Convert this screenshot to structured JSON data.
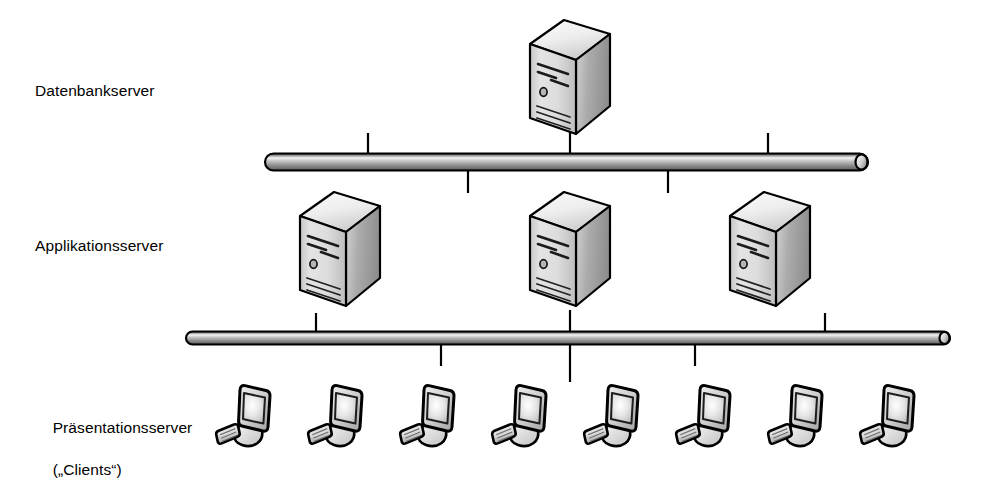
{
  "diagram": {
    "type": "three-tier-architecture",
    "background_color": "#ffffff",
    "line_color": "#000000",
    "tiers": [
      {
        "id": "database",
        "label": "Datenbankserver",
        "node_type": "server-tower",
        "node_count": 1,
        "nodes": [
          {
            "x": 570,
            "y": 85
          }
        ]
      },
      {
        "id": "application",
        "label": "Applikationsserver",
        "node_type": "server-tower",
        "node_count": 3,
        "nodes": [
          {
            "x": 340,
            "y": 250
          },
          {
            "x": 570,
            "y": 250
          },
          {
            "x": 770,
            "y": 250
          }
        ]
      },
      {
        "id": "presentation",
        "label": "Präsentationsserver",
        "label_line2": "(„Clients“)",
        "node_type": "workstation",
        "node_count": 8,
        "nodes": [
          {
            "x": 250,
            "y": 415
          },
          {
            "x": 342,
            "y": 415
          },
          {
            "x": 434,
            "y": 415
          },
          {
            "x": 526,
            "y": 415
          },
          {
            "x": 618,
            "y": 415
          },
          {
            "x": 710,
            "y": 415
          },
          {
            "x": 802,
            "y": 415
          },
          {
            "x": 894,
            "y": 415
          }
        ]
      }
    ],
    "buses": [
      {
        "id": "upper-bus",
        "name": "Netzwerkbus oben",
        "x1": 265,
        "x2": 868,
        "y": 162,
        "thickness": 17,
        "stubs_up": [
          368,
          768
        ],
        "stubs_down": [
          468,
          668
        ]
      },
      {
        "id": "lower-bus",
        "name": "Netzwerkbus unten",
        "x1": 186,
        "x2": 950,
        "y": 338,
        "thickness": 13,
        "stubs_up": [
          316,
          570,
          825
        ],
        "stubs_down": [
          441,
          695
        ]
      }
    ],
    "colors": {
      "server_front": "#d9d9d9",
      "server_side": "#9e9e9e",
      "server_top": "#f2f2f2",
      "bus_light": "#f0f0f0",
      "bus_mid": "#9a9a9a",
      "bus_dark": "#4a4a4a",
      "screen": "#e8e8e8",
      "outline": "#000000"
    }
  }
}
